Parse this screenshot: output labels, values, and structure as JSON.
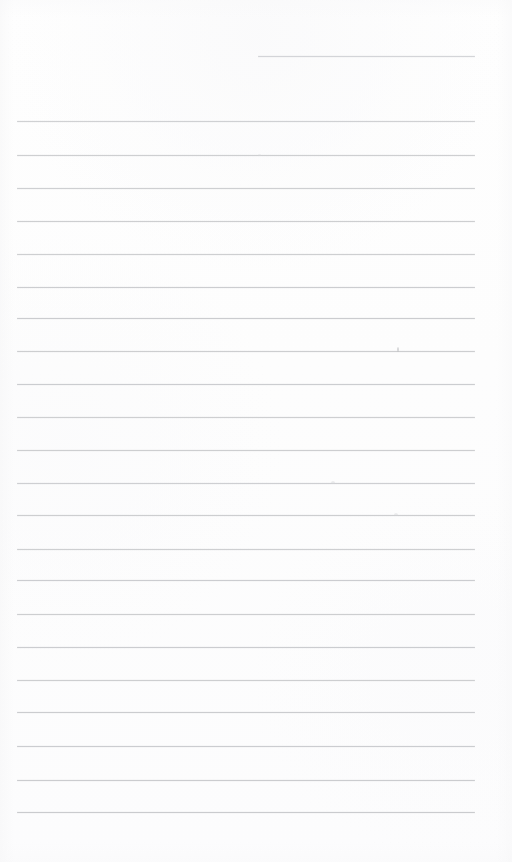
{
  "page": {
    "kind": "scanned-blank-lined-page",
    "width_px": 512,
    "height_px": 862,
    "background_color": "#fdfdfd",
    "paper_tone_color": "#fefefe",
    "rule_color": "#c8c9cc",
    "rule_color_light": "#d6d7da",
    "rule_thickness_px": 1,
    "content_text": "",
    "handwriting_text": "",
    "printed_text": "",
    "notes_visible": "none"
  },
  "geometry": {
    "rule_left_x": 17,
    "rule_right_x": 475,
    "rule_span_px": 458,
    "left_margin_px": 17,
    "right_margin_px": 37,
    "top_margin_px": 56,
    "bottom_margin_px": 50,
    "rule_spacing_px": 33.1,
    "first_full_rule_y": 121,
    "last_full_rule_y": 812,
    "full_rule_count": 22
  },
  "top_partial_rule": {
    "name": "header-rule",
    "y": 56,
    "x_start": 258,
    "x_end": 475,
    "width_px": 217,
    "color": "#cfd0d3",
    "opacity": 0.85
  },
  "rules": [
    {
      "index": 1,
      "y": 121,
      "x_start": 17,
      "x_end": 475,
      "opacity": 0.8
    },
    {
      "index": 2,
      "y": 155,
      "x_start": 17,
      "x_end": 475,
      "opacity": 0.86
    },
    {
      "index": 3,
      "y": 188,
      "x_start": 17,
      "x_end": 475,
      "opacity": 0.84
    },
    {
      "index": 4,
      "y": 221,
      "x_start": 17,
      "x_end": 475,
      "opacity": 0.88
    },
    {
      "index": 5,
      "y": 254,
      "x_start": 17,
      "x_end": 475,
      "opacity": 0.86
    },
    {
      "index": 6,
      "y": 287,
      "x_start": 17,
      "x_end": 475,
      "opacity": 0.9
    },
    {
      "index": 7,
      "y": 318,
      "x_start": 17,
      "x_end": 475,
      "opacity": 0.92
    },
    {
      "index": 8,
      "y": 351,
      "x_start": 17,
      "x_end": 475,
      "opacity": 0.88
    },
    {
      "index": 9,
      "y": 384,
      "x_start": 17,
      "x_end": 475,
      "opacity": 0.9
    },
    {
      "index": 10,
      "y": 417,
      "x_start": 17,
      "x_end": 475,
      "opacity": 0.86
    },
    {
      "index": 11,
      "y": 450,
      "x_start": 17,
      "x_end": 475,
      "opacity": 0.88
    },
    {
      "index": 12,
      "y": 483,
      "x_start": 17,
      "x_end": 475,
      "opacity": 0.84
    },
    {
      "index": 13,
      "y": 515,
      "x_start": 17,
      "x_end": 475,
      "opacity": 0.88
    },
    {
      "index": 14,
      "y": 549,
      "x_start": 17,
      "x_end": 475,
      "opacity": 0.86
    },
    {
      "index": 15,
      "y": 580,
      "x_start": 17,
      "x_end": 475,
      "opacity": 0.9
    },
    {
      "index": 16,
      "y": 614,
      "x_start": 17,
      "x_end": 475,
      "opacity": 0.88
    },
    {
      "index": 17,
      "y": 647,
      "x_start": 17,
      "x_end": 475,
      "opacity": 0.9
    },
    {
      "index": 18,
      "y": 680,
      "x_start": 17,
      "x_end": 475,
      "opacity": 0.88
    },
    {
      "index": 19,
      "y": 712,
      "x_start": 17,
      "x_end": 475,
      "opacity": 0.92
    },
    {
      "index": 20,
      "y": 746,
      "x_start": 17,
      "x_end": 475,
      "opacity": 0.9
    },
    {
      "index": 21,
      "y": 780,
      "x_start": 17,
      "x_end": 475,
      "opacity": 0.92
    },
    {
      "index": 22,
      "y": 812,
      "x_start": 17,
      "x_end": 475,
      "opacity": 0.94
    }
  ],
  "artifacts": [
    {
      "name": "tick-mark",
      "x": 397,
      "y": 350,
      "w": 2,
      "h": 5,
      "color": "#b9babd",
      "opacity": 0.55
    },
    {
      "name": "faint-spot",
      "x": 331,
      "y": 483,
      "w": 4,
      "h": 3,
      "color": "#d2d3d6",
      "opacity": 0.4
    },
    {
      "name": "faint-spot",
      "x": 394,
      "y": 515,
      "w": 4,
      "h": 3,
      "color": "#d2d3d6",
      "opacity": 0.38
    },
    {
      "name": "faint-spot",
      "x": 258,
      "y": 155,
      "w": 3,
      "h": 2,
      "color": "#d8d9dc",
      "opacity": 0.35
    }
  ]
}
